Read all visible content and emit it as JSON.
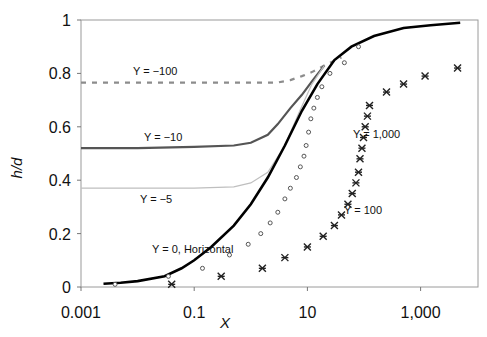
{
  "chart_data": {
    "type": "line",
    "title": "",
    "xlabel": "X",
    "ylabel": "h/d",
    "xscale": "log",
    "xlim": [
      0.001,
      10000
    ],
    "ylim": [
      0,
      1
    ],
    "x_ticks": [
      "0.001",
      "0.1",
      "10",
      "1,000"
    ],
    "y_ticks": [
      "0",
      "0.2",
      "0.4",
      "0.6",
      "0.8",
      "1"
    ],
    "grid": false,
    "legend": "none (inline annotations)",
    "annotations": [
      {
        "text": "Y = −100",
        "series": "Y = -100"
      },
      {
        "text": "Y = −10",
        "series": "Y = -10"
      },
      {
        "text": "Y = −5",
        "series": "Y = -5"
      },
      {
        "text": "Y = 0, Horizontal",
        "series": "Y = 0, Horizontal"
      },
      {
        "text": "Y = 100",
        "series": "Y = 100"
      },
      {
        "text": "Y = 1,000",
        "series": "Y = 1,000"
      }
    ],
    "series": [
      {
        "name": "Y = -100",
        "style": "dashed",
        "color": "#8c8c8c",
        "x": [
          0.001,
          0.01,
          0.1,
          1,
          3,
          5,
          8,
          12,
          20,
          40
        ],
        "y": [
          0.765,
          0.765,
          0.765,
          0.765,
          0.766,
          0.775,
          0.79,
          0.805,
          0.83,
          0.86
        ]
      },
      {
        "name": "Y = -10",
        "style": "solid",
        "color": "#555555",
        "x": [
          0.001,
          0.01,
          0.1,
          0.5,
          1,
          2,
          3,
          5,
          8,
          12,
          20
        ],
        "y": [
          0.52,
          0.52,
          0.525,
          0.53,
          0.54,
          0.57,
          0.61,
          0.67,
          0.72,
          0.77,
          0.83
        ]
      },
      {
        "name": "Y = -5",
        "style": "solid-thin",
        "color": "#bfbfbf",
        "x": [
          0.001,
          0.01,
          0.1,
          0.5,
          1,
          2,
          4,
          7,
          12,
          20
        ],
        "y": [
          0.37,
          0.37,
          0.37,
          0.375,
          0.39,
          0.43,
          0.53,
          0.65,
          0.76,
          0.83
        ]
      },
      {
        "name": "Y = 0, Horizontal",
        "style": "solid-thick",
        "color": "#000000",
        "x": [
          0.0025,
          0.005,
          0.01,
          0.03,
          0.06,
          0.1,
          0.2,
          0.5,
          1,
          2,
          4,
          8,
          15,
          30,
          60,
          150,
          500,
          1500,
          5000
        ],
        "y": [
          0.012,
          0.016,
          0.022,
          0.04,
          0.07,
          0.1,
          0.15,
          0.23,
          0.31,
          0.41,
          0.53,
          0.66,
          0.76,
          0.85,
          0.9,
          0.94,
          0.97,
          0.98,
          0.99
        ]
      },
      {
        "name": "Y = 100",
        "style": "circle-markers",
        "color": "#555555",
        "x": [
          0.004,
          0.035,
          0.14,
          0.42,
          0.9,
          1.5,
          2.2,
          3.0,
          4.0,
          5.0,
          6.4,
          7.5,
          8.7,
          9.5,
          10.5,
          11.5,
          13,
          15,
          18,
          25,
          45,
          80
        ],
        "y": [
          0.01,
          0.04,
          0.07,
          0.12,
          0.16,
          0.2,
          0.24,
          0.28,
          0.33,
          0.37,
          0.41,
          0.45,
          0.49,
          0.53,
          0.58,
          0.63,
          0.67,
          0.71,
          0.75,
          0.8,
          0.84,
          0.9
        ]
      },
      {
        "name": "Y = 1,000",
        "style": "asterisk-markers",
        "color": "#222222",
        "x": [
          0.04,
          0.3,
          1.6,
          4,
          10,
          19,
          30,
          40,
          52,
          62,
          72,
          80,
          85,
          92,
          98,
          105,
          115,
          125,
          250,
          500,
          1200,
          4500
        ],
        "y": [
          0.01,
          0.04,
          0.07,
          0.11,
          0.15,
          0.19,
          0.23,
          0.27,
          0.31,
          0.35,
          0.39,
          0.43,
          0.48,
          0.52,
          0.56,
          0.6,
          0.64,
          0.68,
          0.73,
          0.76,
          0.79,
          0.82
        ]
      }
    ]
  },
  "labels": {
    "ylabel": "h/d",
    "xlabel": "X"
  }
}
